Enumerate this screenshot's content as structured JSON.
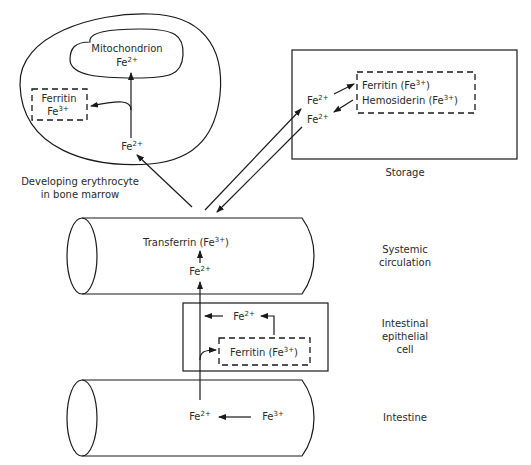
{
  "diagram": {
    "erythrocyte": {
      "label_line1": "Developing erythrocyte",
      "label_line2": "in bone marrow",
      "mitochondrion": {
        "label": "Mitochondrion",
        "ion": "Fe",
        "charge": "2+"
      },
      "ferritin": {
        "label": "Ferritin",
        "ion": "Fe",
        "charge": "3+"
      },
      "fe_entry": {
        "ion": "Fe",
        "charge": "2+"
      }
    },
    "storage": {
      "label": "Storage",
      "fe_top": {
        "ion": "Fe",
        "charge": "2+"
      },
      "fe_bottom": {
        "ion": "Fe",
        "charge": "2+"
      },
      "ferritin": {
        "label": "Ferritin (Fe",
        "charge": "3+",
        "close": ")"
      },
      "hemosiderin": {
        "label": "Hemosiderin (Fe",
        "charge": "3+",
        "close": ")"
      }
    },
    "systemic": {
      "label_line1": "Systemic",
      "label_line2": "circulation",
      "transferrin": {
        "label": "Transferrin (Fe",
        "charge": "3+",
        "close": ")"
      },
      "fe": {
        "ion": "Fe",
        "charge": "2+"
      }
    },
    "epithelial": {
      "label_line1": "Intestinal",
      "label_line2": "epithelial",
      "label_line3": "cell",
      "fe": {
        "ion": "Fe",
        "charge": "2+"
      },
      "ferritin": {
        "label": "Ferritin (Fe",
        "charge": "3+",
        "close": ")"
      }
    },
    "intestine": {
      "label": "Intestine",
      "fe_left": {
        "ion": "Fe",
        "charge": "2+"
      },
      "fe_right": {
        "ion": "Fe",
        "charge": "3+"
      }
    }
  }
}
